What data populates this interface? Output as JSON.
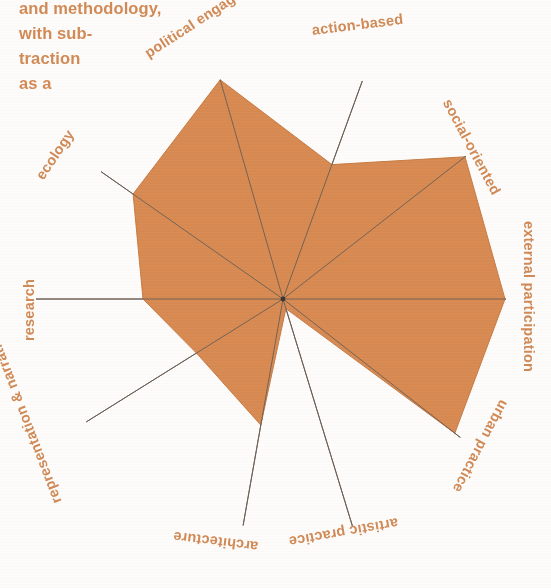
{
  "body_text": "and methodology,\nwith sub-\ntraction\nas a",
  "colors": {
    "fill": "#d98c54",
    "fill_edge": "#c87c45",
    "spoke": "#5a5048",
    "label": "#d08a57",
    "background": "#fdfcfa"
  },
  "chart_data": {
    "type": "radar",
    "title": "",
    "xlabel": "",
    "ylabel": "",
    "rmax": 1,
    "grid": false,
    "legend": false,
    "categories": [
      "political engagement",
      "action-based",
      "social-oriented",
      "external participation",
      "urban practice",
      "artistic practice",
      "architecture",
      "representation & narrative",
      "research",
      "ecology"
    ],
    "values": [
      0.97,
      0.52,
      0.88,
      1.0,
      0.82,
      0.04,
      0.58,
      0.42,
      0.62,
      0.82
    ],
    "series": [
      {
        "name": "profile",
        "values": [
          0.97,
          0.52,
          0.88,
          1.0,
          0.82,
          0.04,
          0.58,
          0.42,
          0.62,
          0.82
        ]
      }
    ]
  },
  "geometry": {
    "center_x": 283,
    "center_y": 299,
    "axes": [
      {
        "name": "political engagement",
        "angle_deg": -106,
        "spoke_len": 228,
        "value_r": 228
      },
      {
        "name": "action-based",
        "angle_deg": -70,
        "spoke_len": 232,
        "value_r": 143
      },
      {
        "name": "social-oriented",
        "angle_deg": -38,
        "spoke_len": 232,
        "value_r": 231
      },
      {
        "name": "external participation",
        "angle_deg": 0,
        "spoke_len": 223,
        "value_r": 222
      },
      {
        "name": "urban practice",
        "angle_deg": 38,
        "spoke_len": 225,
        "value_r": 218
      },
      {
        "name": "artistic practice",
        "angle_deg": 73,
        "spoke_len": 238,
        "value_r": 10
      },
      {
        "name": "architecture",
        "angle_deg": 100,
        "spoke_len": 230,
        "value_r": 128
      },
      {
        "name": "representation & narrative",
        "angle_deg": 148,
        "spoke_len": 232,
        "value_r": 102
      },
      {
        "name": "research",
        "angle_deg": 180,
        "spoke_len": 247,
        "value_r": 140
      },
      {
        "name": "ecology",
        "angle_deg": -145,
        "spoke_len": 222,
        "value_r": 183
      }
    ]
  },
  "labels": [
    {
      "text": "political engagement",
      "x": 146,
      "y": 46,
      "rotate": -33
    },
    {
      "text": "action-based",
      "x": 312,
      "y": 22,
      "rotate": -7
    },
    {
      "text": "social-oriented",
      "x": 447,
      "y": 92,
      "rotate": 62
    },
    {
      "text": "external participation",
      "x": 529,
      "y": 213,
      "rotate": 90
    },
    {
      "text": "urban practice",
      "x": 505,
      "y": 393,
      "rotate": 118
    },
    {
      "text": "artistic practice",
      "x": 398,
      "y": 515,
      "rotate": 170
    },
    {
      "text": "architecture",
      "x": 258,
      "y": 539,
      "rotate": 187
    },
    {
      "text": "representation & narrative",
      "x": 57,
      "y": 495,
      "rotate": 249
    },
    {
      "text": "research",
      "x": 29,
      "y": 333,
      "rotate": 270
    },
    {
      "text": "ecology",
      "x": 39,
      "y": 170,
      "rotate": -56
    }
  ]
}
